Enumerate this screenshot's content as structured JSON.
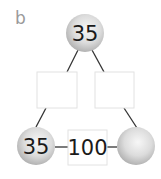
{
  "diagram": {
    "part_label": "b",
    "type": "arithmagon",
    "circles": {
      "top": "35",
      "bottom_left": "35",
      "bottom_right": ""
    },
    "boxes": {
      "left": "",
      "right": "",
      "bottom": "100"
    },
    "colors": {
      "circle_fill_light": "#f4f4f4",
      "circle_fill_dark": "#b9b9b9",
      "box_border": "#e0e0e0",
      "line": "#333333"
    }
  }
}
